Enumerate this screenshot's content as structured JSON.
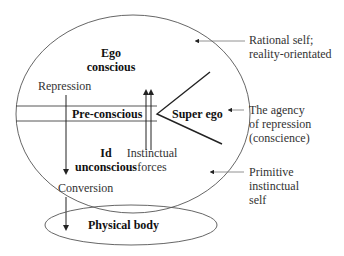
{
  "diagram": {
    "regions": {
      "ego": {
        "title": "Ego",
        "subtitle": "conscious"
      },
      "preconscious": {
        "title": "Pre-conscious"
      },
      "superego": {
        "title": "Super ego"
      },
      "id": {
        "title": "Id",
        "subtitle": "unconscious"
      },
      "physical_body": {
        "title": "Physical body"
      }
    },
    "processes": {
      "repression": "Repression",
      "conversion": "Conversion",
      "instinctual_forces": {
        "line1": "Instinctual",
        "line2": "forces"
      }
    },
    "annotations": {
      "rational_self": {
        "line1": "Rational self;",
        "line2": "reality-orientated"
      },
      "agency_of_repression": {
        "line1": "The agency",
        "line2": "of repression",
        "line3": "(conscience)"
      },
      "primitive_self": {
        "line1": "Primitive",
        "line2": "instinctual",
        "line3": "self"
      }
    },
    "colors": {
      "stroke": "#333333",
      "thin_stroke": "#555555",
      "background": "#ffffff"
    }
  }
}
